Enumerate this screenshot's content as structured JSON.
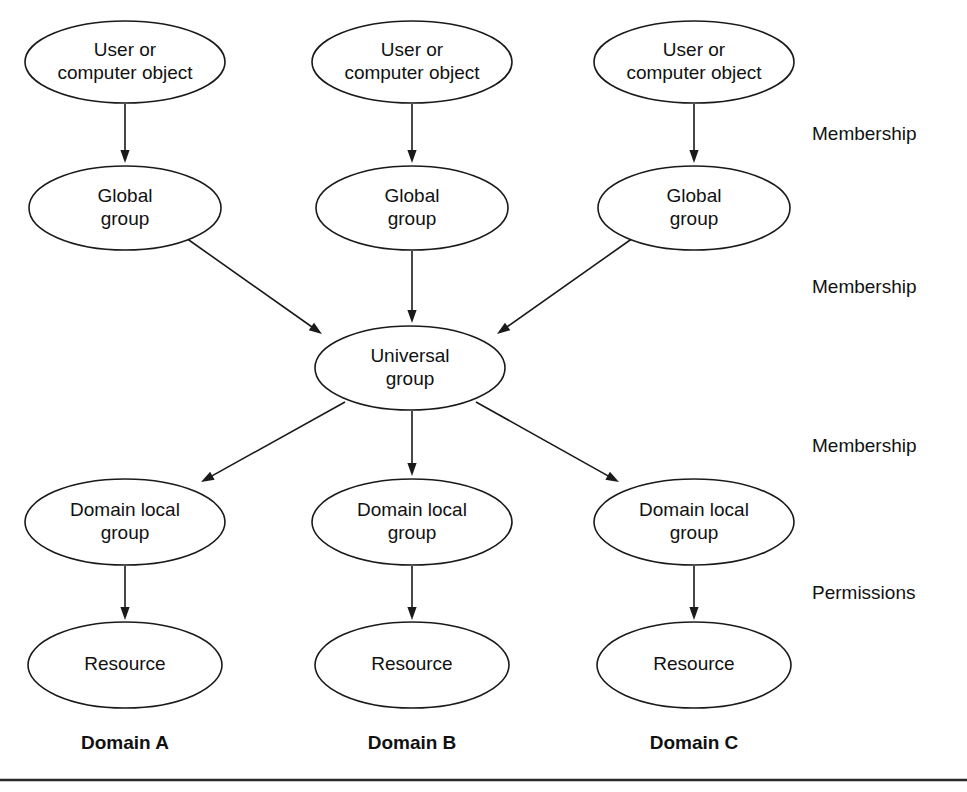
{
  "figure": {
    "background_color": "#ffffff",
    "stroke_color": "#1a1a1a",
    "text_color": "#111111",
    "width": 967,
    "height": 792
  },
  "chart_data": {
    "type": "diagram",
    "layout": "three-column flow converging on a single Universal group",
    "columns": [
      {
        "id": "a",
        "label": "Domain A",
        "center_x": 125
      },
      {
        "id": "b",
        "label": "Domain B",
        "center_x": 412
      },
      {
        "id": "c",
        "label": "Domain C",
        "center_x": 694
      }
    ],
    "rows": [
      {
        "id": "object",
        "label": "User or computer object",
        "center_y": 62
      },
      {
        "id": "global",
        "label": "Global group",
        "center_y": 208
      },
      {
        "id": "universal",
        "label": "Universal group",
        "center_y": 368
      },
      {
        "id": "local",
        "label": "Domain local group",
        "center_y": 522
      },
      {
        "id": "resource",
        "label": "Resource",
        "center_y": 665
      }
    ],
    "nodes": [
      {
        "id": "obj-a",
        "line1": "User or",
        "line2": "computer object",
        "cx": 125,
        "cy": 62,
        "rx": 100,
        "ry": 41
      },
      {
        "id": "obj-b",
        "line1": "User or",
        "line2": "computer object",
        "cx": 412,
        "cy": 62,
        "rx": 100,
        "ry": 41
      },
      {
        "id": "obj-c",
        "line1": "User or",
        "line2": "computer object",
        "cx": 694,
        "cy": 62,
        "rx": 100,
        "ry": 41
      },
      {
        "id": "glob-a",
        "line1": "Global",
        "line2": "group",
        "cx": 125,
        "cy": 208,
        "rx": 96,
        "ry": 42
      },
      {
        "id": "glob-b",
        "line1": "Global",
        "line2": "group",
        "cx": 412,
        "cy": 208,
        "rx": 96,
        "ry": 42
      },
      {
        "id": "glob-c",
        "line1": "Global",
        "line2": "group",
        "cx": 694,
        "cy": 208,
        "rx": 96,
        "ry": 42
      },
      {
        "id": "univ",
        "line1": "Universal",
        "line2": "group",
        "cx": 410,
        "cy": 368,
        "rx": 95,
        "ry": 42
      },
      {
        "id": "loc-a",
        "line1": "Domain local",
        "line2": "group",
        "cx": 125,
        "cy": 522,
        "rx": 100,
        "ry": 43
      },
      {
        "id": "loc-b",
        "line1": "Domain local",
        "line2": "group",
        "cx": 412,
        "cy": 522,
        "rx": 100,
        "ry": 43
      },
      {
        "id": "loc-c",
        "line1": "Domain local",
        "line2": "group",
        "cx": 694,
        "cy": 522,
        "rx": 100,
        "ry": 43
      },
      {
        "id": "res-a",
        "line1": "Resource",
        "line2": "",
        "cx": 125,
        "cy": 665,
        "rx": 97,
        "ry": 43
      },
      {
        "id": "res-b",
        "line1": "Resource",
        "line2": "",
        "cx": 412,
        "cy": 665,
        "rx": 97,
        "ry": 43
      },
      {
        "id": "res-c",
        "line1": "Resource",
        "line2": "",
        "cx": 694,
        "cy": 665,
        "rx": 97,
        "ry": 43
      }
    ],
    "edges": [
      {
        "id": "e-obj-a-glob-a",
        "from": "obj-a",
        "to": "glob-a",
        "x1": 125,
        "y1": 104,
        "x2": 125,
        "y2": 163,
        "relation": "Membership"
      },
      {
        "id": "e-obj-b-glob-b",
        "from": "obj-b",
        "to": "glob-b",
        "x1": 412,
        "y1": 104,
        "x2": 412,
        "y2": 163,
        "relation": "Membership"
      },
      {
        "id": "e-obj-c-glob-c",
        "from": "obj-c",
        "to": "glob-c",
        "x1": 694,
        "y1": 104,
        "x2": 694,
        "y2": 163,
        "relation": "Membership"
      },
      {
        "id": "e-glob-a-univ",
        "from": "glob-a",
        "to": "univ",
        "x1": 186,
        "y1": 238,
        "x2": 322,
        "y2": 334,
        "relation": "Membership"
      },
      {
        "id": "e-glob-b-univ",
        "from": "glob-b",
        "to": "univ",
        "x1": 412,
        "y1": 251,
        "x2": 412,
        "y2": 323,
        "relation": "Membership"
      },
      {
        "id": "e-glob-c-univ",
        "from": "glob-c",
        "to": "univ",
        "x1": 633,
        "y1": 238,
        "x2": 497,
        "y2": 334,
        "relation": "Membership"
      },
      {
        "id": "e-univ-loc-a",
        "from": "univ",
        "to": "loc-a",
        "x1": 345,
        "y1": 402,
        "x2": 201,
        "y2": 482,
        "relation": "Membership"
      },
      {
        "id": "e-univ-loc-b",
        "from": "univ",
        "to": "loc-b",
        "x1": 412,
        "y1": 411,
        "x2": 412,
        "y2": 476,
        "relation": "Membership"
      },
      {
        "id": "e-univ-loc-c",
        "from": "univ",
        "to": "loc-c",
        "x1": 476,
        "y1": 402,
        "x2": 619,
        "y2": 482,
        "relation": "Membership"
      },
      {
        "id": "e-loc-a-res-a",
        "from": "loc-a",
        "to": "res-a",
        "x1": 125,
        "y1": 566,
        "x2": 125,
        "y2": 620,
        "relation": "Permissions"
      },
      {
        "id": "e-loc-b-res-b",
        "from": "loc-b",
        "to": "res-b",
        "x1": 412,
        "y1": 566,
        "x2": 412,
        "y2": 620,
        "relation": "Permissions"
      },
      {
        "id": "e-loc-c-res-c",
        "from": "loc-c",
        "to": "res-c",
        "x1": 694,
        "y1": 566,
        "x2": 694,
        "y2": 620,
        "relation": "Permissions"
      }
    ],
    "stage_labels": [
      {
        "id": "stage-1",
        "text": "Membership",
        "x": 812,
        "y": 135
      },
      {
        "id": "stage-2",
        "text": "Membership",
        "x": 812,
        "y": 288
      },
      {
        "id": "stage-3",
        "text": "Membership",
        "x": 812,
        "y": 447
      },
      {
        "id": "stage-4",
        "text": "Permissions",
        "x": 812,
        "y": 594
      }
    ],
    "domain_labels": [
      {
        "id": "domain-a",
        "text": "Domain A",
        "x": 125,
        "y": 744
      },
      {
        "id": "domain-b",
        "text": "Domain B",
        "x": 412,
        "y": 744
      },
      {
        "id": "domain-c",
        "text": "Domain C",
        "x": 694,
        "y": 744
      }
    ],
    "footer_rule": {
      "x1": 0,
      "y1": 780,
      "x2": 967,
      "y2": 780
    }
  }
}
